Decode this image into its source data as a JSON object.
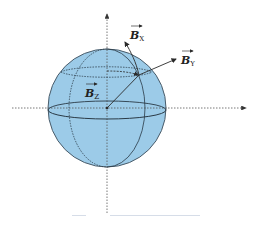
{
  "diagram": {
    "labels": {
      "bx": {
        "main": "B",
        "sub": "X"
      },
      "by": {
        "main": "B",
        "sub": "Y"
      },
      "bz": {
        "main": "B",
        "sub": "Z"
      }
    },
    "colors": {
      "sphere_fill": "#9ccbe8",
      "sphere_stroke": "#4a5c6a",
      "line": "#2a2a2a",
      "axis": "#555555"
    }
  },
  "caption": {
    "text": ""
  }
}
